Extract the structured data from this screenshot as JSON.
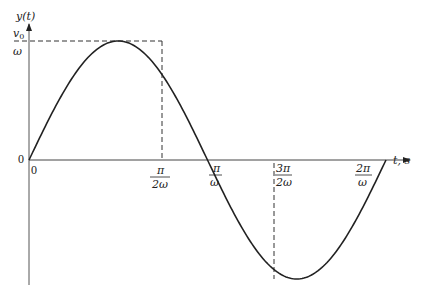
{
  "chart_data": {
    "type": "line",
    "title": "",
    "function": "y(t) = (v0/ω) sin(ωt)",
    "xlabel": "t, s",
    "ylabel": "y(t)",
    "x_ticks": [
      "0",
      "π/2ω",
      "π/ω",
      "3π/2ω",
      "2π/ω"
    ],
    "y_ticks": [
      "0",
      "v0/ω"
    ],
    "x": [
      0,
      0.25,
      0.5,
      0.75,
      1.0,
      1.25,
      1.5,
      1.75,
      2.0
    ],
    "x_units": "π/ω",
    "values": [
      0,
      0.707,
      1,
      0.707,
      0,
      -0.707,
      -1,
      -0.707,
      0
    ],
    "y_units": "v0/ω",
    "ylim": [
      -1,
      1
    ],
    "grid": false,
    "annotations": [
      "dashed line from peak to y-axis at v0/ω",
      "dashed vertical at π/2ω",
      "dashed vertical at 3π/2ω"
    ]
  },
  "labels": {
    "y_axis": "y(t)",
    "y_tick_num": "v",
    "y_tick_sub": "0",
    "y_tick_den": "ω",
    "y_zero": "0",
    "x_zero": "0",
    "x1_num": "π",
    "x1_den": "2ω",
    "x2_num": "π",
    "x2_den": "ω",
    "x3_num": "3π",
    "x3_den": "2ω",
    "x4_num": "2π",
    "x4_den": "ω",
    "x_axis": "t, s"
  }
}
